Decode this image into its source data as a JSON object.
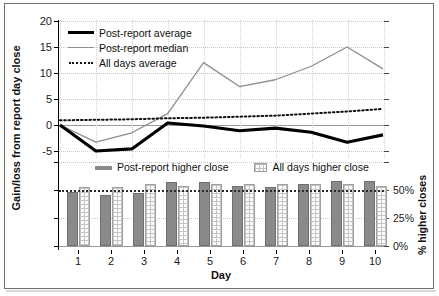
{
  "figure": {
    "left_axis_title": "Gain/loss from report day close",
    "right_axis_title": "% higher closes",
    "x_axis_title": "Day"
  },
  "top_legend": [
    {
      "label": "Post-report average",
      "style": "thick-black-line",
      "color": "#000000"
    },
    {
      "label": "Post-report median",
      "style": "thin-gray-line",
      "color": "#8d8d8d"
    },
    {
      "label": "All days average",
      "style": "dotted-black-line",
      "color": "#111111"
    }
  ],
  "bottom_legend": [
    {
      "label": "Post-report higher close",
      "style": "solid-gray-bar",
      "color": "#8a8a8a"
    },
    {
      "label": "All days higher close",
      "style": "hatched-bar",
      "color": "#c4c4c4"
    }
  ],
  "top_y_ticks": [
    "20",
    "15",
    "10",
    "5",
    "0",
    "-5"
  ],
  "bottom_y_ticks": [
    "50%",
    "25%",
    "0%"
  ],
  "x_ticks": [
    "1",
    "2",
    "3",
    "4",
    "5",
    "6",
    "7",
    "8",
    "9",
    "10"
  ],
  "chart_data": [
    {
      "type": "line",
      "id": "top-panel",
      "title": "",
      "xlabel": "Day",
      "ylabel": "Gain/loss from report day close",
      "x": [
        1,
        2,
        3,
        4,
        5,
        6,
        7,
        8,
        9,
        10
      ],
      "xlim": [
        1,
        10
      ],
      "ylim": [
        -7.5,
        20
      ],
      "yticks": [
        20,
        15,
        10,
        5,
        0,
        -5
      ],
      "grid": true,
      "legend_position": "upper-left-inside",
      "series": [
        {
          "name": "Post-report average",
          "style": "thick solid black",
          "color": "#000000",
          "values": [
            0.0,
            -5.0,
            -4.6,
            0.4,
            -0.2,
            -1.1,
            -0.6,
            -1.4,
            -3.3,
            -1.9
          ]
        },
        {
          "name": "Post-report median",
          "style": "thin solid gray",
          "color": "#8d8d8d",
          "values": [
            0.0,
            -3.3,
            -1.5,
            2.2,
            12.0,
            7.4,
            8.7,
            11.3,
            15.0,
            10.8
          ]
        },
        {
          "name": "All days average",
          "style": "dotted black",
          "color": "#111111",
          "values": [
            0.9,
            1.0,
            1.1,
            1.3,
            1.4,
            1.6,
            1.8,
            2.2,
            2.6,
            3.1
          ]
        }
      ]
    },
    {
      "type": "bar",
      "id": "bottom-panel",
      "title": "",
      "xlabel": "Day",
      "ylabel": "% higher closes",
      "categories": [
        "1",
        "2",
        "3",
        "4",
        "5",
        "6",
        "7",
        "8",
        "9",
        "10"
      ],
      "ylim": [
        0,
        75
      ],
      "yticks": [
        0,
        25,
        50
      ],
      "ytick_labels": [
        "0%",
        "25%",
        "50%"
      ],
      "reference_line": 50,
      "grid": true,
      "legend_position": "top-center",
      "series": [
        {
          "name": "Post-report higher close",
          "color": "#8a8a8a",
          "values": [
            48,
            46,
            47,
            57,
            57,
            54,
            53,
            55,
            58,
            58
          ]
        },
        {
          "name": "All days higher close",
          "color": "#c4c4c4",
          "values": [
            53,
            53,
            55,
            54,
            55,
            55,
            55,
            55,
            55,
            54
          ]
        }
      ]
    }
  ]
}
